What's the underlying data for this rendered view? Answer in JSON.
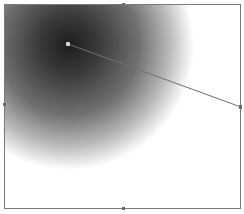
{
  "editor": {
    "type": "radial-gradient-editor",
    "colors": {
      "center": "#1e1e1e",
      "edge": "#ffffff",
      "border": "#7a7a7a",
      "handle_line": "#707070"
    },
    "center_handle": {
      "x": 68,
      "y": 44
    },
    "radius_handle": {
      "x": 241,
      "y": 107
    },
    "edge_handles": [
      "top",
      "left",
      "right",
      "bottom"
    ]
  }
}
